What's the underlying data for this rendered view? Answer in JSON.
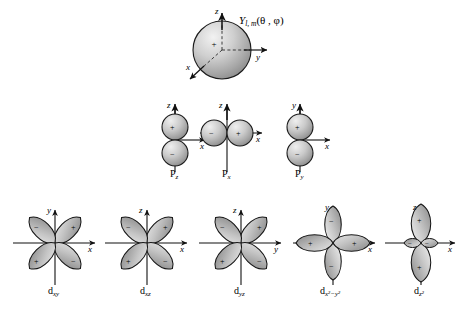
{
  "figure": {
    "title_formula": {
      "symbol": "Y",
      "subscript": "l, m",
      "args": "(θ , φ)"
    },
    "colors": {
      "lobe_light": "#e8e8e8",
      "lobe_mid": "#b8b8b8",
      "lobe_dark": "#8f8f8f",
      "outline": "#151515",
      "axis": "#111111",
      "background": "#ffffff"
    },
    "rows": [
      {
        "name": "s-orbital-row",
        "items": [
          {
            "label": "",
            "label_sub": "",
            "label_sup": "",
            "type": "sphere",
            "axes": [
              "z",
              "y",
              "x"
            ]
          }
        ]
      },
      {
        "name": "p-orbital-row",
        "items": [
          {
            "label": "P",
            "label_sub": "z",
            "label_sup": "",
            "type": "dumbbell-vertical",
            "axes": [
              "z",
              "x"
            ],
            "signs": [
              "+",
              "−"
            ]
          },
          {
            "label": "P",
            "label_sub": "x",
            "label_sup": "",
            "type": "dumbbell-horizontal",
            "axes": [
              "z",
              "x"
            ],
            "signs": [
              "−",
              "+"
            ]
          },
          {
            "label": "P",
            "label_sub": "y",
            "label_sup": "",
            "type": "dumbbell-vertical",
            "axes": [
              "y",
              "x"
            ],
            "signs": [
              "+",
              "−"
            ]
          }
        ]
      },
      {
        "name": "d-orbital-row",
        "items": [
          {
            "label": "d",
            "label_sub": "xy",
            "label_sup": "",
            "type": "cloverleaf-diagonal",
            "axes": [
              "y",
              "x"
            ],
            "signs": [
              "−",
              "+",
              "+",
              "−"
            ]
          },
          {
            "label": "d",
            "label_sub": "xz",
            "label_sup": "",
            "type": "cloverleaf-diagonal",
            "axes": [
              "z",
              "x"
            ],
            "signs": [
              "−",
              "+",
              "+",
              "−"
            ]
          },
          {
            "label": "d",
            "label_sub": "yz",
            "label_sup": "",
            "type": "cloverleaf-diagonal",
            "axes": [
              "z",
              "y"
            ],
            "signs": [
              "−",
              "+",
              "+",
              "−"
            ]
          },
          {
            "label": "d",
            "label_sub": "x²−y²",
            "label_sup": "",
            "type": "cloverleaf-axial",
            "axes": [
              "y",
              "x"
            ],
            "signs": [
              "−",
              "+",
              "−",
              "+"
            ]
          },
          {
            "label": "d",
            "label_sub": "z²",
            "label_sup": "",
            "type": "dz2",
            "axes": [
              "z",
              "x"
            ],
            "signs": [
              "+",
              "−",
              "+",
              "−"
            ]
          }
        ]
      }
    ],
    "axis_labels": {
      "x": "x",
      "y": "y",
      "z": "z"
    }
  }
}
